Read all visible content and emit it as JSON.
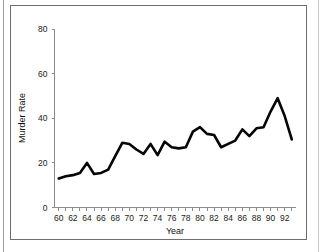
{
  "figure": {
    "frame_color": "#6e6e6e",
    "background_color": "#ffffff"
  },
  "chart_data": {
    "type": "line",
    "title": "",
    "xlabel": "Year",
    "ylabel": "Murder Rate",
    "xlim": [
      59.4,
      93.6
    ],
    "ylim": [
      0,
      80
    ],
    "grid": false,
    "legend": "none",
    "line_color": "#050505",
    "x_tick_labels": [
      "60",
      "62",
      "64",
      "66",
      "68",
      "70",
      "72",
      "74",
      "76",
      "78",
      "80",
      "82",
      "84",
      "86",
      "88",
      "90",
      "92"
    ],
    "x_tick_values": [
      60,
      62,
      64,
      66,
      68,
      70,
      72,
      74,
      76,
      78,
      80,
      82,
      84,
      86,
      88,
      90,
      92
    ],
    "x_minor_tick_values": [
      60,
      61,
      62,
      63,
      64,
      65,
      66,
      67,
      68,
      69,
      70,
      71,
      72,
      73,
      74,
      75,
      76,
      77,
      78,
      79,
      80,
      81,
      82,
      83,
      84,
      85,
      86,
      87,
      88,
      89,
      90,
      91,
      92,
      93
    ],
    "y_tick_labels": [
      "0",
      "20",
      "40",
      "60",
      "80"
    ],
    "y_tick_values": [
      0,
      20,
      40,
      60,
      80
    ],
    "x": [
      60,
      61,
      62,
      63,
      64,
      65,
      66,
      67,
      68,
      69,
      70,
      71,
      72,
      73,
      74,
      75,
      76,
      77,
      78,
      79,
      80,
      81,
      82,
      83,
      84,
      85,
      86,
      87,
      88,
      89,
      90,
      91,
      92,
      93
    ],
    "values": [
      13,
      14,
      14.5,
      15.5,
      20,
      15,
      15.5,
      17,
      23,
      29,
      28.5,
      26,
      24,
      28.5,
      23.5,
      29.5,
      27,
      26.5,
      27,
      34,
      36,
      33,
      32.5,
      27,
      28.5,
      30,
      35,
      32,
      35.5,
      36,
      43,
      49,
      41,
      30.5
    ]
  }
}
